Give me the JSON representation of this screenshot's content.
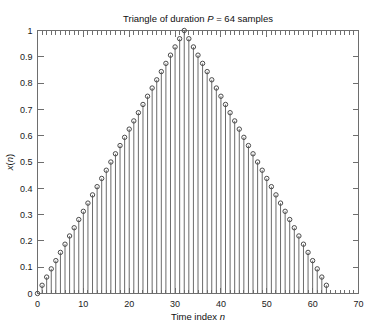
{
  "chart_data": {
    "type": "scatter",
    "render_style": "stem",
    "title": "Triangle of duration P = 64 samples",
    "title_parts": [
      {
        "text": "Triangle of duration ",
        "italic": false
      },
      {
        "text": "P",
        "italic": true
      },
      {
        "text": " = 64 samples",
        "italic": false
      }
    ],
    "xlabel": "Time index n",
    "xlabel_parts": [
      {
        "text": "Time index ",
        "italic": false
      },
      {
        "text": "n",
        "italic": true
      }
    ],
    "ylabel": "x(n)",
    "ylabel_parts": [
      {
        "text": "x",
        "italic": true
      },
      {
        "text": "(",
        "italic": false
      },
      {
        "text": "n",
        "italic": true
      },
      {
        "text": ")",
        "italic": false
      }
    ],
    "xlim": [
      0,
      70
    ],
    "ylim": [
      0,
      1
    ],
    "xticks": [
      0,
      10,
      20,
      30,
      40,
      50,
      60,
      70
    ],
    "xtick_labels": [
      "0",
      "10",
      "20",
      "30",
      "40",
      "50",
      "60",
      "70"
    ],
    "yticks": [
      0,
      0.1,
      0.2,
      0.3,
      0.4,
      0.5,
      0.6,
      0.7,
      0.8,
      0.9,
      1
    ],
    "ytick_labels": [
      "0",
      "0.1",
      "0.2",
      "0.3",
      "0.4",
      "0.5",
      "0.6",
      "0.7",
      "0.8",
      "0.9",
      "1"
    ],
    "minor_xticks_step": 1,
    "grid": false,
    "legend": null,
    "marker": "open-circle",
    "duration_P": 64,
    "peak_index": 32,
    "peak_value": 1,
    "x": [
      0,
      1,
      2,
      3,
      4,
      5,
      6,
      7,
      8,
      9,
      10,
      11,
      12,
      13,
      14,
      15,
      16,
      17,
      18,
      19,
      20,
      21,
      22,
      23,
      24,
      25,
      26,
      27,
      28,
      29,
      30,
      31,
      32,
      33,
      34,
      35,
      36,
      37,
      38,
      39,
      40,
      41,
      42,
      43,
      44,
      45,
      46,
      47,
      48,
      49,
      50,
      51,
      52,
      53,
      54,
      55,
      56,
      57,
      58,
      59,
      60,
      61,
      62,
      63
    ],
    "values": [
      0,
      0.03125,
      0.0625,
      0.09375,
      0.125,
      0.15625,
      0.1875,
      0.21875,
      0.25,
      0.28125,
      0.3125,
      0.34375,
      0.375,
      0.40625,
      0.4375,
      0.46875,
      0.5,
      0.53125,
      0.5625,
      0.59375,
      0.625,
      0.65625,
      0.6875,
      0.71875,
      0.75,
      0.78125,
      0.8125,
      0.84375,
      0.875,
      0.90625,
      0.9375,
      0.96875,
      1,
      0.96875,
      0.9375,
      0.90625,
      0.875,
      0.84375,
      0.8125,
      0.78125,
      0.75,
      0.71875,
      0.6875,
      0.65625,
      0.625,
      0.59375,
      0.5625,
      0.53125,
      0.5,
      0.46875,
      0.4375,
      0.40625,
      0.375,
      0.34375,
      0.3125,
      0.28125,
      0.25,
      0.21875,
      0.1875,
      0.15625,
      0.125,
      0.09375,
      0.0625,
      0.03125
    ]
  },
  "colors": {
    "axis": "#6e6e6e",
    "stem": "#6b6b6b",
    "marker": "#4a4a4a",
    "text": "#101010",
    "background": "#ffffff"
  }
}
